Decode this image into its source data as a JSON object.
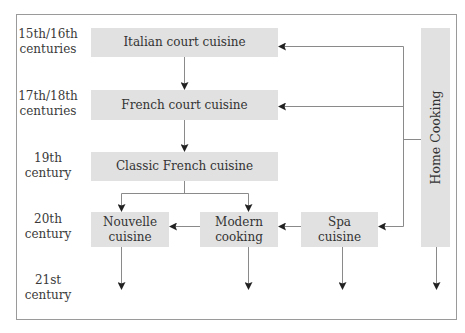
{
  "diagram": {
    "eras": [
      {
        "line1": "15th/16th",
        "line2": "centuries"
      },
      {
        "line1": "17th/18th",
        "line2": "centuries"
      },
      {
        "line1": "19th",
        "line2": "century"
      },
      {
        "line1": "20th",
        "line2": "century"
      },
      {
        "line1": "21st",
        "line2": "century"
      }
    ],
    "nodes": {
      "italian": "Italian court cuisine",
      "french_court": "French court cuisine",
      "classic": "Classic French cuisine",
      "nouvelle_1": "Nouvelle",
      "nouvelle_2": "cuisine",
      "modern_1": "Modern",
      "modern_2": "cooking",
      "spa_1": "Spa",
      "spa_2": "cuisine",
      "home": "Home Cooking"
    },
    "edges": [
      {
        "from": "Italian court cuisine",
        "to": "French court cuisine"
      },
      {
        "from": "French court cuisine",
        "to": "Classic French cuisine"
      },
      {
        "from": "Classic French cuisine",
        "to": "Nouvelle cuisine"
      },
      {
        "from": "Classic French cuisine",
        "to": "Modern cooking"
      },
      {
        "from": "Modern cooking",
        "to": "Nouvelle cuisine"
      },
      {
        "from": "Spa cuisine",
        "to": "Modern cooking"
      },
      {
        "from": "Home Cooking",
        "to": "Italian court cuisine"
      },
      {
        "from": "Home Cooking",
        "to": "French court cuisine"
      },
      {
        "from": "Home Cooking",
        "to": "Spa cuisine"
      },
      {
        "from": "Nouvelle cuisine",
        "to": "21st century"
      },
      {
        "from": "Modern cooking",
        "to": "21st century"
      },
      {
        "from": "Spa cuisine",
        "to": "21st century"
      },
      {
        "from": "Home Cooking",
        "to": "21st century"
      }
    ],
    "colors": {
      "box": "#e1e1e1",
      "line": "#8a8a8a",
      "arrowhead": "#222222",
      "frame": "#9a9a9a"
    }
  }
}
